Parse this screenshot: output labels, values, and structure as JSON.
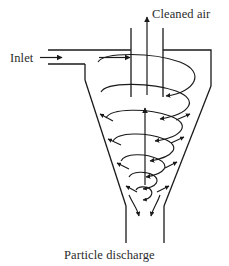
{
  "figure": {
    "type": "process-flow-diagram",
    "width": 229,
    "height": 266,
    "background_color": "#ffffff",
    "line_color": "#1a1a1a",
    "text_color": "#2b2b2b"
  },
  "labels": {
    "inlet": "Inlet",
    "cleaned_air": "Cleaned air",
    "particle_discharge": "Particle discharge"
  },
  "components": {
    "inlet_duct": "inlet-duct",
    "vortex_finder": "vortex-finder-tube",
    "cylindrical_body": "cyclone-cylindrical-body",
    "conical_section": "cyclone-conical-section",
    "discharge_outlet": "particle-discharge-outlet",
    "outer_vortex": "outer-descending-vortex-spiral",
    "inner_vortex": "inner-ascending-vortex-arrow",
    "wall_arrows": "particle-wall-migration-arrows"
  },
  "flows": [
    {
      "name": "inlet-flow",
      "label": "Inlet",
      "direction": "rightward"
    },
    {
      "name": "clean-gas-outflow",
      "label": "Cleaned air",
      "direction": "upward"
    },
    {
      "name": "solids-outflow",
      "label": "Particle discharge",
      "direction": "downward"
    }
  ]
}
